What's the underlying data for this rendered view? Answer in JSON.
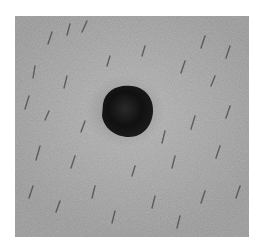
{
  "image": {
    "subject": "dark pigmented skin lesion with surrounding hairs (grayscale)",
    "background_color": "#ffffff",
    "skin_tone": "#a8a8a8",
    "lesion_color": "#0e0e0e"
  }
}
